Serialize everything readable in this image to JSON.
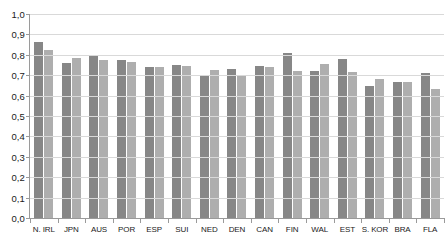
{
  "chart_data": {
    "type": "bar",
    "title": "",
    "xlabel": "",
    "ylabel": "",
    "ylim": [
      0,
      1.0
    ],
    "ytick_labels": [
      "1,0",
      "0,9",
      "0,8",
      "0,7",
      "0,6",
      "0,5",
      "0,4",
      "0,3",
      "0,2",
      "0,1",
      "0,0"
    ],
    "ytick_values": [
      1.0,
      0.9,
      0.8,
      0.7,
      0.6,
      0.5,
      0.4,
      0.3,
      0.2,
      0.1,
      0.0
    ],
    "grid": true,
    "legend": "none",
    "categories": [
      "N. IRL",
      "JPN",
      "AUS",
      "POR",
      "ESP",
      "SUI",
      "NED",
      "DEN",
      "CAN",
      "FIN",
      "WAL",
      "EST",
      "S. KOR",
      "BRA",
      "FLA"
    ],
    "series": [
      {
        "name": "series-1",
        "color": "#878787",
        "values": [
          0.865,
          0.76,
          0.8,
          0.775,
          0.74,
          0.75,
          0.7,
          0.73,
          0.745,
          0.81,
          0.72,
          0.78,
          0.645,
          0.665,
          0.71
        ]
      },
      {
        "name": "series-2",
        "color": "#aeaeae",
        "values": [
          0.825,
          0.785,
          0.775,
          0.765,
          0.74,
          0.745,
          0.725,
          0.7,
          0.74,
          0.72,
          0.755,
          0.715,
          0.68,
          0.665,
          0.63
        ]
      }
    ]
  }
}
